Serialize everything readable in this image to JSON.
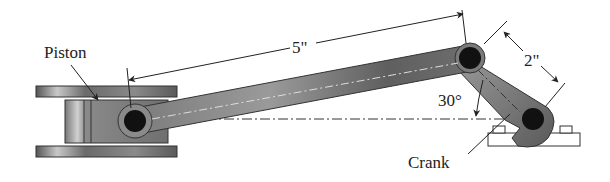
{
  "diagram": {
    "type": "slider-crank mechanism",
    "labels": {
      "piston": "Piston",
      "crank": "Crank",
      "connecting_rod_length": "5\"",
      "crank_length": "2\"",
      "crank_angle": "30°"
    },
    "colors": {
      "metal_dark": "#4a4a4a",
      "metal_mid": "#7a7a7a",
      "metal_light": "#b5b5b5",
      "pin": "#111111",
      "line": "#222222",
      "background": "#ffffff"
    }
  }
}
